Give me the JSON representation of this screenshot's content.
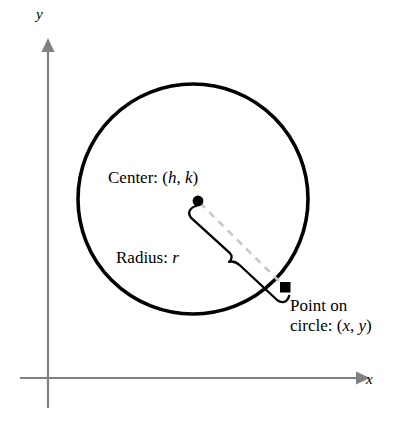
{
  "figure": {
    "background_color": "#ffffff"
  },
  "axes": {
    "x_label": "x",
    "y_label": "y",
    "color": "#808080",
    "origin": {
      "x": 48,
      "y": 378
    }
  },
  "circle": {
    "center": {
      "x": 193,
      "y": 199
    },
    "radius": 115,
    "stroke_color": "#000000"
  },
  "annotations": {
    "center": {
      "prefix": "Center: (",
      "var1": "h",
      "separator": ", ",
      "var2": "k",
      "suffix": ")",
      "full_text": "Center: (h, k)"
    },
    "radius": {
      "prefix": "Radius: ",
      "var1": "r",
      "full_text": "Radius: r"
    },
    "point": {
      "line1": "Point on",
      "prefix": "circle: (",
      "var1": "x",
      "separator": ", ",
      "var2": "y",
      "suffix": ")",
      "full_text": "Point on circle: (x, y)"
    }
  },
  "markers": {
    "center_dot": {
      "x": 198,
      "y": 201,
      "shape": "circle",
      "color": "#000000"
    },
    "circle_point": {
      "x": 285,
      "y": 287,
      "shape": "square",
      "color": "#000000"
    }
  },
  "radius_line": {
    "style": "dashed",
    "color": "#c8c8c8",
    "from": {
      "x": 198,
      "y": 201
    },
    "to": {
      "x": 285,
      "y": 287
    }
  },
  "brace": {
    "color": "#000000",
    "orientation": "diagonal"
  }
}
